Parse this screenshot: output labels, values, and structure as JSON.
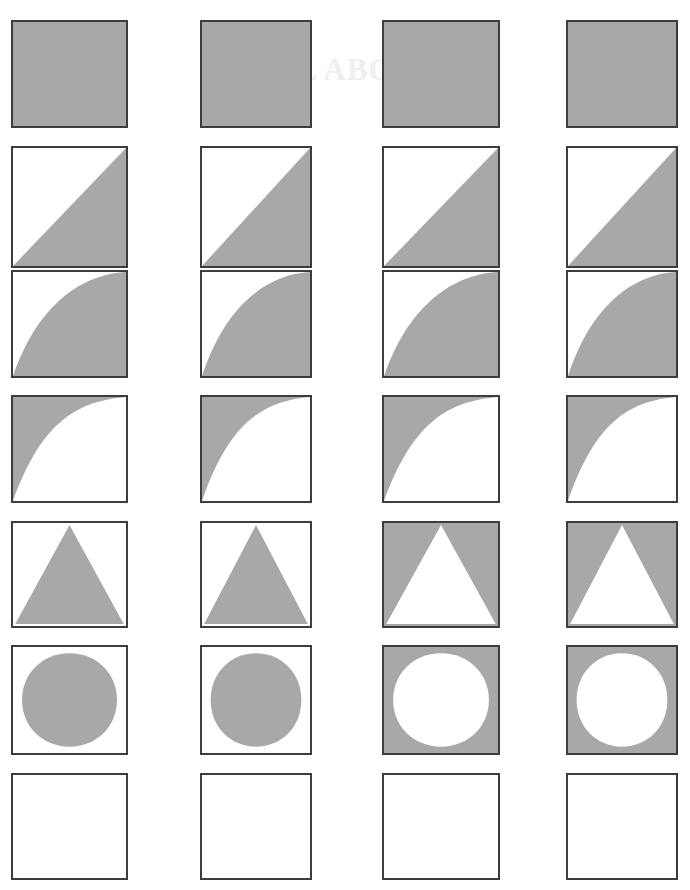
{
  "page": {
    "background_color": "#ffffff",
    "width": 690,
    "height": 890,
    "watermark_text": "ALL ABOUT",
    "watermark_color": "#f3eeec"
  },
  "style": {
    "fill_gray": "#a8a8a8",
    "fill_white": "#ffffff",
    "border_color": "#3d3d3d",
    "border_width": 2
  },
  "grid": {
    "rows": 7,
    "columns": 4,
    "column_x": [
      11,
      200,
      382,
      566
    ],
    "column_w": [
      117,
      112,
      118,
      112
    ],
    "row_y": [
      20,
      146,
      270,
      395,
      521,
      645,
      773
    ],
    "row_h": [
      108,
      122,
      108,
      108,
      107,
      110,
      107
    ]
  },
  "tiles": [
    {
      "row": 0,
      "col": 0,
      "shape": "full-square",
      "polarity": "positive",
      "label": "solid-filled-square"
    },
    {
      "row": 0,
      "col": 1,
      "shape": "full-square",
      "polarity": "positive",
      "label": "solid-filled-square"
    },
    {
      "row": 0,
      "col": 2,
      "shape": "full-square",
      "polarity": "positive",
      "label": "solid-filled-square"
    },
    {
      "row": 0,
      "col": 3,
      "shape": "full-square",
      "polarity": "positive",
      "label": "solid-filled-square"
    },
    {
      "row": 1,
      "col": 0,
      "shape": "diagonal-half",
      "polarity": "positive",
      "label": "lower-right-diagonal-half"
    },
    {
      "row": 1,
      "col": 1,
      "shape": "diagonal-half",
      "polarity": "positive",
      "label": "lower-right-diagonal-half"
    },
    {
      "row": 1,
      "col": 2,
      "shape": "diagonal-half",
      "polarity": "positive",
      "label": "lower-right-diagonal-half"
    },
    {
      "row": 1,
      "col": 3,
      "shape": "diagonal-half",
      "polarity": "positive",
      "label": "lower-right-diagonal-half"
    },
    {
      "row": 2,
      "col": 0,
      "shape": "convex-curve",
      "polarity": "positive",
      "label": "convex-curve-filled-below"
    },
    {
      "row": 2,
      "col": 1,
      "shape": "convex-curve",
      "polarity": "positive",
      "label": "convex-curve-filled-below"
    },
    {
      "row": 2,
      "col": 2,
      "shape": "convex-curve",
      "polarity": "positive",
      "label": "convex-curve-filled-below"
    },
    {
      "row": 2,
      "col": 3,
      "shape": "convex-curve",
      "polarity": "positive",
      "label": "convex-curve-filled-below"
    },
    {
      "row": 3,
      "col": 0,
      "shape": "concave-curve",
      "polarity": "positive",
      "label": "concave-curve-filled-above"
    },
    {
      "row": 3,
      "col": 1,
      "shape": "concave-curve",
      "polarity": "positive",
      "label": "concave-curve-filled-above"
    },
    {
      "row": 3,
      "col": 2,
      "shape": "concave-curve",
      "polarity": "positive",
      "label": "concave-curve-filled-above"
    },
    {
      "row": 3,
      "col": 3,
      "shape": "concave-curve",
      "polarity": "positive",
      "label": "concave-curve-filled-above"
    },
    {
      "row": 4,
      "col": 0,
      "shape": "triangle",
      "polarity": "positive",
      "label": "filled-triangle"
    },
    {
      "row": 4,
      "col": 1,
      "shape": "triangle",
      "polarity": "positive",
      "label": "filled-triangle"
    },
    {
      "row": 4,
      "col": 2,
      "shape": "triangle",
      "polarity": "negative",
      "label": "inverted-triangle"
    },
    {
      "row": 4,
      "col": 3,
      "shape": "triangle",
      "polarity": "negative",
      "label": "inverted-triangle"
    },
    {
      "row": 5,
      "col": 0,
      "shape": "circle",
      "polarity": "positive",
      "label": "filled-circle"
    },
    {
      "row": 5,
      "col": 1,
      "shape": "circle",
      "polarity": "positive",
      "label": "filled-circle"
    },
    {
      "row": 5,
      "col": 2,
      "shape": "circle",
      "polarity": "negative",
      "label": "inverted-circle"
    },
    {
      "row": 5,
      "col": 3,
      "shape": "circle",
      "polarity": "negative",
      "label": "inverted-circle"
    },
    {
      "row": 6,
      "col": 0,
      "shape": "empty-square",
      "polarity": "positive",
      "label": "empty-square"
    },
    {
      "row": 6,
      "col": 1,
      "shape": "empty-square",
      "polarity": "positive",
      "label": "empty-square"
    },
    {
      "row": 6,
      "col": 2,
      "shape": "empty-square",
      "polarity": "positive",
      "label": "empty-square"
    },
    {
      "row": 6,
      "col": 3,
      "shape": "empty-square",
      "polarity": "positive",
      "label": "empty-square"
    }
  ]
}
